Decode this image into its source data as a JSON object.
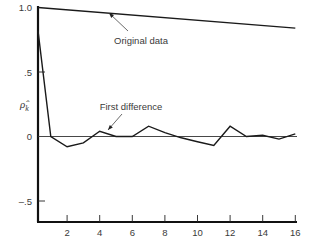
{
  "chart_data": {
    "type": "line",
    "title": "",
    "xlabel": "",
    "ylabel": "ρ̂_k",
    "xlim": [
      0,
      16
    ],
    "ylim": [
      -0.65,
      1.0
    ],
    "grid": false,
    "x_ticks": [
      2,
      4,
      6,
      8,
      10,
      12,
      14,
      16
    ],
    "x_tick_labels": [
      "2",
      "4",
      "6",
      "8",
      "10",
      "12",
      "14",
      "16"
    ],
    "y_ticks": [
      1.0,
      0.5,
      0,
      -0.5
    ],
    "y_tick_labels": [
      "1.0",
      ".5",
      "0",
      "–.5"
    ],
    "zero_line": true,
    "series": [
      {
        "name": "Original data",
        "x": [
          0,
          16
        ],
        "values": [
          1.0,
          0.84
        ]
      },
      {
        "name": "First difference",
        "x": [
          0.2,
          1,
          2,
          3,
          4,
          5,
          6,
          7,
          8,
          9,
          10,
          11,
          12,
          13,
          14,
          15,
          16
        ],
        "values": [
          0.82,
          0.0,
          -0.08,
          -0.05,
          0.04,
          0.0,
          0.0,
          0.08,
          0.03,
          -0.01,
          -0.04,
          -0.07,
          0.08,
          0.0,
          0.01,
          -0.02,
          0.02
        ]
      }
    ],
    "annotations": [
      {
        "text": "Original data",
        "target_series": "Original data",
        "arrow_to_x": 4.5
      },
      {
        "text": "First difference",
        "target_series": "First difference",
        "arrow_to_x": 4.5
      }
    ]
  }
}
